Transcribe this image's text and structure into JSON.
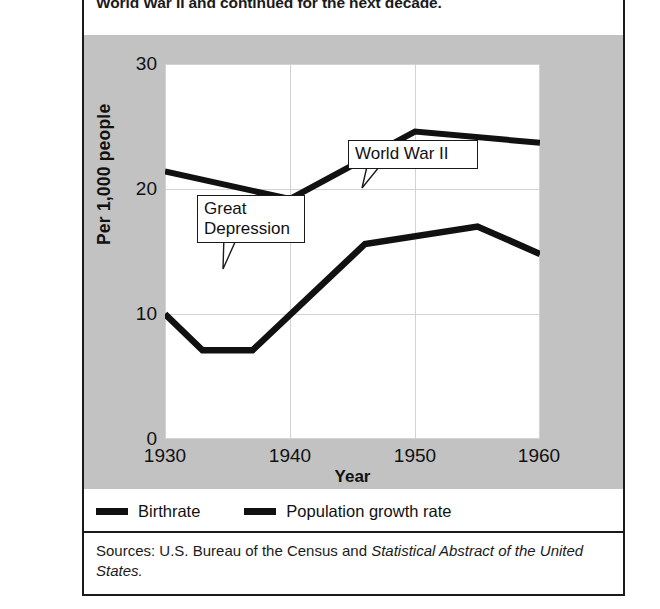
{
  "figure": {
    "intro_text": "World War II and continued for the next decade.",
    "source_prefix": "Sources: U.S. Bureau of the Census and ",
    "source_italic": "Statistical Abstract of the United States.",
    "panel_color": "#c2c2c2",
    "line_color": "#111111",
    "border_color": "#1a1a1a"
  },
  "chart_data": {
    "type": "line",
    "title": "",
    "xlabel": "Year",
    "ylabel": "Per 1,000 people",
    "xlim": [
      1930,
      1960
    ],
    "ylim": [
      0,
      30
    ],
    "xticks": [
      1930,
      1940,
      1950,
      1960
    ],
    "yticks": [
      0,
      10,
      20,
      30
    ],
    "grid": true,
    "legend_position": "below-plot",
    "series": [
      {
        "name": "Birthrate",
        "color": "#111111",
        "x": [
          1930,
          1940,
          1950,
          1960
        ],
        "values": [
          21.4,
          19.2,
          24.6,
          23.7
        ]
      },
      {
        "name": "Population growth rate",
        "color": "#111111",
        "x": [
          1930,
          1933,
          1937,
          1946,
          1955,
          1960
        ],
        "values": [
          10.0,
          7.1,
          7.1,
          15.6,
          17.0,
          14.8
        ]
      }
    ],
    "annotations": [
      {
        "label": "Great\nDepression",
        "target_year": 1934,
        "target_value": 7.1
      },
      {
        "label": "World War II",
        "target_year": 1946,
        "target_value": 15.6
      }
    ]
  },
  "legend": {
    "items": [
      {
        "label": "Birthrate"
      },
      {
        "label": "Population growth rate"
      }
    ]
  },
  "axis_labels": {
    "y": [
      "30",
      "20",
      "10",
      "0"
    ],
    "x": [
      "1930",
      "1940",
      "1950",
      "1960"
    ]
  }
}
